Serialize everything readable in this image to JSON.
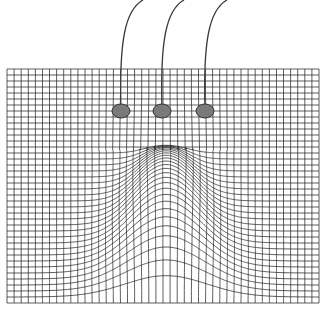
{
  "figure": {
    "background": "#ffffff",
    "line_color": "#2a2a2a"
  },
  "grid": {
    "x0": 7,
    "y0": 69,
    "x1": 319,
    "y1": 303,
    "cols": 44,
    "rows": 39
  },
  "deformation": {
    "center_x": 166,
    "peak_y": 145,
    "start_row_y": 150,
    "base_sigma": 42,
    "top_sigma": 18
  },
  "electrodes": [
    {
      "cx": 121,
      "cy": 111,
      "rx": 9,
      "ry": 7,
      "fill": "#7a7a7a",
      "wire_top": [
        143,
        0
      ]
    },
    {
      "cx": 162,
      "cy": 111,
      "rx": 9,
      "ry": 7,
      "fill": "#7a7a7a",
      "wire_top": [
        184,
        0
      ]
    },
    {
      "cx": 205,
      "cy": 111,
      "rx": 9,
      "ry": 7,
      "fill": "#7a7a7a",
      "wire_top": [
        227,
        0
      ]
    }
  ]
}
